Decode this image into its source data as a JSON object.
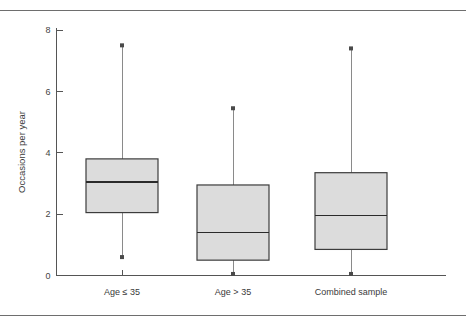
{
  "figure": {
    "background_color": "#ffffff",
    "rule_color": "#6e6e6e",
    "box_fill_color": "#dcdcdc",
    "box_stroke_color": "#3c3c3c",
    "whisker_color": "#8a8a8a"
  },
  "chart_data": {
    "type": "box",
    "title": "",
    "xlabel": "",
    "ylabel": "Occasions per year",
    "ylim": [
      0,
      8
    ],
    "yticks": [
      0,
      2,
      4,
      6,
      8
    ],
    "ytick_labels": [
      "0",
      "2",
      "4",
      "6",
      "8"
    ],
    "grid": false,
    "legend": "none",
    "categories": [
      "Age ≤ 35",
      "Age > 35",
      "Combined sample"
    ],
    "boxes": [
      {
        "category": "Age ≤ 35",
        "whisker_low": 0.6,
        "q1": 2.05,
        "median": 3.05,
        "q3": 3.8,
        "whisker_high": 7.5
      },
      {
        "category": "Age > 35",
        "whisker_low": 0.05,
        "q1": 0.5,
        "median": 1.4,
        "q3": 2.95,
        "whisker_high": 5.45
      },
      {
        "category": "Combined sample",
        "whisker_low": 0.05,
        "q1": 0.85,
        "median": 1.95,
        "q3": 3.35,
        "whisker_high": 7.4
      }
    ]
  }
}
